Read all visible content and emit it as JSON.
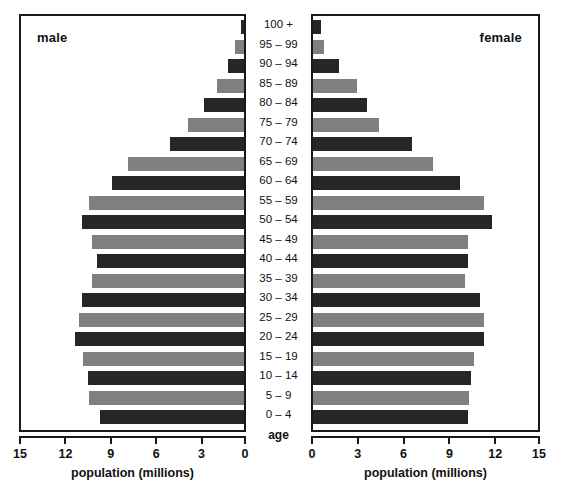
{
  "panels": {
    "male": {
      "title": "male",
      "axis_title": "population (millions)",
      "ticks": [
        "15",
        "12",
        "9",
        "6",
        "3",
        "0"
      ]
    },
    "female": {
      "title": "female",
      "axis_title": "population (millions)",
      "ticks": [
        "0",
        "3",
        "6",
        "9",
        "12",
        "15"
      ]
    }
  },
  "center": {
    "axis_title": "age"
  },
  "colors": {
    "dark": "#262626",
    "gray": "#808080",
    "frame": "#1a1a1a",
    "background": "#ffffff"
  },
  "chart_data": {
    "type": "bar",
    "title": "",
    "subtitle": "",
    "orientation": "horizontal",
    "layout": "population-pyramid",
    "xlabel": "population (millions)",
    "ylabel": "age",
    "grid": false,
    "legend": "none",
    "xlim_male": [
      15,
      0
    ],
    "xlim_female": [
      0,
      15
    ],
    "xticks_male": [
      15,
      12,
      9,
      6,
      3,
      0
    ],
    "xticks_female": [
      0,
      3,
      6,
      9,
      12,
      15
    ],
    "categories": [
      "100 +",
      "95 – 99",
      "90 – 94",
      "85 – 89",
      "80 – 84",
      "75 – 79",
      "70 – 74",
      "65 – 69",
      "60 – 64",
      "55 – 59",
      "50 – 54",
      "45 – 49",
      "40 – 44",
      "35 – 39",
      "30 – 34",
      "25 – 29",
      "20 – 24",
      "15 – 19",
      "10 – 14",
      "5 – 9",
      "0 – 4"
    ],
    "series": [
      {
        "name": "male",
        "side": "left",
        "values": [
          0.2,
          0.6,
          1.1,
          1.8,
          2.7,
          3.8,
          5.0,
          7.8,
          8.9,
          10.4,
          10.9,
          10.2,
          9.9,
          10.2,
          10.9,
          11.1,
          11.4,
          10.8,
          10.5,
          10.4,
          9.7
        ]
      },
      {
        "name": "female",
        "side": "right",
        "values": [
          0.5,
          0.7,
          1.7,
          2.9,
          3.6,
          4.4,
          6.6,
          8.0,
          9.8,
          11.4,
          11.9,
          10.3,
          10.3,
          10.1,
          11.1,
          11.4,
          11.4,
          10.7,
          10.5,
          10.4,
          10.3
        ]
      }
    ],
    "bar_color_pattern": [
      "dark",
      "gray",
      "dark",
      "gray",
      "dark",
      "gray",
      "dark",
      "gray",
      "dark",
      "gray",
      "dark",
      "gray",
      "dark",
      "gray",
      "dark",
      "gray",
      "dark",
      "gray",
      "dark",
      "gray",
      "dark"
    ]
  }
}
